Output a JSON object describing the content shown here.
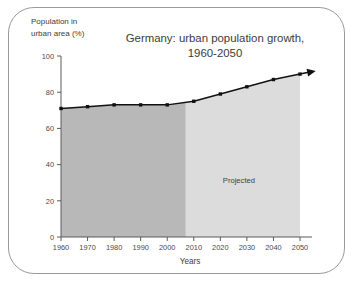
{
  "chart_data": {
    "type": "area",
    "title": "Germany: urban population growth, 1960-2050",
    "title_line1": "Germany: urban population growth,",
    "title_line2": "1960-2050",
    "xlabel": "Years",
    "ylabel": "Population in urban area (%)",
    "ylabel_line1": "Population in",
    "ylabel_line2": "urban area (%)",
    "xlim": [
      1960,
      2050
    ],
    "ylim": [
      0,
      100
    ],
    "grid": false,
    "legend": "none",
    "x": [
      1960,
      1970,
      1980,
      1990,
      2000,
      2010,
      2020,
      2030,
      2040,
      2050
    ],
    "values": [
      71,
      72,
      73,
      73,
      73,
      75,
      79,
      83,
      87,
      90
    ],
    "categories": [
      "1960",
      "1970",
      "1980",
      "1990",
      "2000",
      "2010",
      "2020",
      "2030",
      "2040",
      "2050"
    ],
    "yticks": [
      0,
      20,
      40,
      60,
      80,
      100
    ],
    "ytick_labels": [
      "0",
      "20",
      "40",
      "60",
      "80",
      "100"
    ],
    "xticks": [
      1960,
      1970,
      1980,
      1990,
      2000,
      2010,
      2020,
      2030,
      2040,
      2050
    ],
    "xtick_labels": [
      "1960",
      "1970",
      "1980",
      "1990",
      "2000",
      "2010",
      "2020",
      "2030",
      "2040",
      "2050"
    ],
    "annotations": [
      {
        "text": "Projected",
        "x": 2027,
        "y": 30
      }
    ],
    "regions": [
      {
        "name": "historical",
        "x_start": 1960,
        "x_end": 2007,
        "color": "#b8b8b8",
        "label": ""
      },
      {
        "name": "projected",
        "x_start": 2007,
        "x_end": 2050,
        "color": "#dcdcdc",
        "label": "Projected"
      }
    ],
    "series": [
      {
        "name": "Urban population share",
        "values": [
          71,
          72,
          73,
          73,
          73,
          75,
          79,
          83,
          87,
          90
        ],
        "line_color": "#111111",
        "marker": "square",
        "arrow_end": true
      }
    ],
    "colors": {
      "historical_fill": "#b8b8b8",
      "projected_fill": "#dcdcdc",
      "line": "#111111",
      "axis": "#5a5a5a",
      "text": "#3d3d3d",
      "frame": "#9a9a9a"
    }
  }
}
